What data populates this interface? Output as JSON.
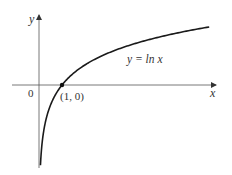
{
  "chart_data": {
    "type": "line",
    "title": "",
    "function": "y = ln x",
    "xlabel": "x",
    "ylabel": "y",
    "origin_label": "0",
    "series": [
      {
        "name": "y = ln x",
        "x": [
          0.063,
          0.1,
          0.2,
          0.5,
          1,
          2,
          3,
          4,
          5,
          6,
          7.4
        ],
        "y": [
          -2.76,
          -2.3,
          -1.61,
          -0.69,
          0,
          0.69,
          1.1,
          1.39,
          1.61,
          1.79,
          2.0
        ]
      }
    ],
    "annotations": [
      {
        "label": "(1, 0)",
        "x": 1,
        "y": 0,
        "marker": "dot"
      },
      {
        "label": "y = ln x",
        "x": 4.0,
        "y": 0.9
      }
    ],
    "xlim": [
      -1.2,
      7.7
    ],
    "ylim": [
      -2.8,
      2.3
    ],
    "grid": false,
    "legend": "none"
  },
  "labels": {
    "y_axis": "y",
    "x_axis": "x",
    "origin": "0",
    "point": "(1, 0)",
    "curve": "y = ln x"
  },
  "colors": {
    "curve": "#1a1a1a",
    "axes": "#555555",
    "text": "#333333"
  }
}
